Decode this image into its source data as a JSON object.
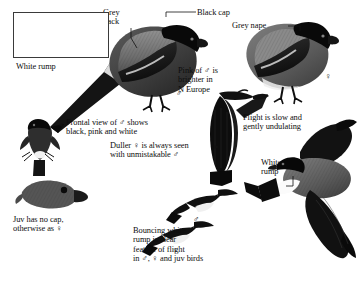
{
  "plate": {
    "subject": "Bullfinch",
    "background_color": "#ffffff",
    "ink_color": "#111111",
    "width": 363,
    "height": 281
  },
  "labels": {
    "grey_back": "Grey\nback",
    "black_cap": "Black cap",
    "grey_nape": "Grey nape",
    "white_rump_left": "White rump",
    "white_rump_right": "White\nrump",
    "pink_of_male": "Pink of ♂ is\nbrighter in\nN Europe",
    "frontal_view": "Frontal view of ♂ shows\nblack, pink and white",
    "duller_female": "Duller ♀ is always seen\nwith unmistakable ♂",
    "flight": "Flight is slow and\ngently undulating",
    "juv": "Juv has no cap,\notherwise as ♀",
    "bouncing": "Bouncing white\nrump is clear\nfeature of flight\nin ♂, ♀ and juv birds"
  },
  "markers": {
    "arrow_left": "◄",
    "arrow_right": "►",
    "male": "♂",
    "female": "♀"
  },
  "sex_marks": [
    {
      "symbol": "♂",
      "subject": "perched-male"
    },
    {
      "symbol": "♀",
      "subject": "perched-female"
    },
    {
      "symbol": "♂",
      "subject": "flying-male-large"
    },
    {
      "symbol": "♂",
      "subject": "flying-male-small"
    },
    {
      "symbol": "♀",
      "subject": "flying-female-small"
    }
  ],
  "inset": {
    "name": "silhouette-inset",
    "bird_count": 2
  }
}
